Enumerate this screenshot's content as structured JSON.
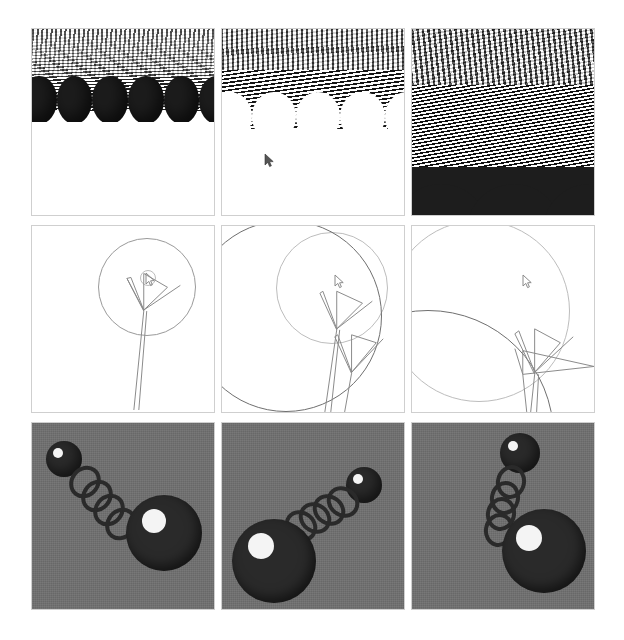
{
  "page": {
    "background_color": "#ffffff",
    "width": 624,
    "height": 640
  },
  "grid": {
    "rows": 3,
    "columns": 3,
    "panel_border_color": "#cfcfcf"
  },
  "panels": [
    {
      "id": "r1c1",
      "row": 1,
      "column": 1,
      "scene": "striped-columns",
      "caption": "striped column field, far view",
      "background_color": "#ffffff",
      "accent_color": "#1c1c1c",
      "cursor": false
    },
    {
      "id": "r1c2",
      "row": 1,
      "column": 2,
      "scene": "striped-columns",
      "caption": "striped column field, mid view",
      "background_color": "#ffffff",
      "accent_color": "#151515",
      "cursor": true
    },
    {
      "id": "r1c3",
      "row": 1,
      "column": 3,
      "scene": "striped-columns",
      "caption": "striped column field, close view",
      "background_color": "#2a2a2a",
      "accent_color": "#101010",
      "cursor": false
    },
    {
      "id": "r2c1",
      "row": 2,
      "column": 1,
      "scene": "line-art-circle",
      "caption": "wireframe circle and arrow, small",
      "background_color": "#ffffff",
      "accent_color": "#8a8a8a",
      "cursor": true
    },
    {
      "id": "r2c2",
      "row": 2,
      "column": 2,
      "scene": "line-art-circle",
      "caption": "wireframe circle and arrow, medium",
      "background_color": "#ffffff",
      "accent_color": "#8a8a8a",
      "cursor": true
    },
    {
      "id": "r2c3",
      "row": 2,
      "column": 3,
      "scene": "line-art-circle",
      "caption": "wireframe circle and arrow, large",
      "background_color": "#ffffff",
      "accent_color": "#8a8a8a",
      "cursor": true
    },
    {
      "id": "r3c1",
      "row": 3,
      "column": 1,
      "scene": "ball-and-chain",
      "caption": "ball and chain, upper-left small ball",
      "background_color": "#6f6f6f",
      "accent_color": "#2a2a2a",
      "cursor": false
    },
    {
      "id": "r3c2",
      "row": 3,
      "column": 2,
      "scene": "ball-and-chain",
      "caption": "ball and chain, upper-right small ball",
      "background_color": "#6f6f6f",
      "accent_color": "#2a2a2a",
      "cursor": false
    },
    {
      "id": "r3c3",
      "row": 3,
      "column": 3,
      "scene": "ball-and-chain",
      "caption": "ball and chain, vertical arrangement",
      "background_color": "#6f6f6f",
      "accent_color": "#2a2a2a",
      "cursor": false
    }
  ],
  "cursor": {
    "glyph": "arrow-pointer",
    "color": "#555555"
  }
}
